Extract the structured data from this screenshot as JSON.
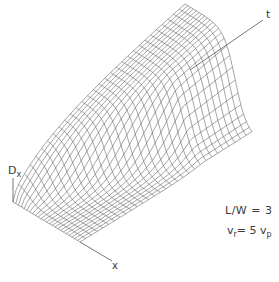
{
  "figure": {
    "type": "3d-wireframe-surface",
    "axes": {
      "vertical": {
        "label": "D",
        "subscript": "x"
      },
      "depth": {
        "label": "x"
      },
      "time": {
        "label": "t"
      }
    },
    "annotations": {
      "ratio": "L/W = 3",
      "velocity": {
        "v1": "v",
        "v1_sub": "r",
        "eq": "= 5 ",
        "v2": "v",
        "v2_sub": "p"
      }
    },
    "style": {
      "line_color": "#5a5a5a",
      "axis_color": "#555555",
      "background": "#ffffff"
    },
    "mesh": {
      "u_lines": 30,
      "v_lines": 24
    }
  }
}
